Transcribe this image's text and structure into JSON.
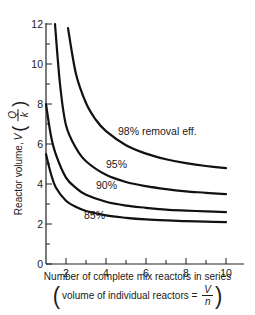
{
  "chart_data": {
    "type": "line",
    "title": "",
    "xlabel": "Number of complete mix reactors in series",
    "xlabel_sub": {
      "prefix": "volume of individual reactors =",
      "fraction_numerator": "V",
      "fraction_denominator": "n"
    },
    "ylabel": {
      "prefix": "Reactor volume,",
      "symbol": "V",
      "fraction_numerator": "Q",
      "fraction_denominator": "k"
    },
    "xlim": [
      1,
      11
    ],
    "ylim": [
      0,
      12
    ],
    "x_ticks": [
      2,
      4,
      6,
      8,
      10
    ],
    "x_minor_ticks": [
      3,
      5,
      7,
      9
    ],
    "y_ticks": [
      0,
      2,
      4,
      6,
      8,
      10,
      12
    ],
    "y_minor_ticks": [
      1,
      3,
      5,
      7,
      9,
      11
    ],
    "grid": false,
    "legend": "inline labels on curves",
    "series": [
      {
        "name": "98% removal eff.",
        "label": "98% removal eff.",
        "x": [
          2.1,
          2.5,
          3,
          3.5,
          4,
          5,
          6,
          7,
          8,
          9,
          10
        ],
        "values": [
          11.8,
          9.5,
          8.05,
          7.2,
          6.64,
          5.94,
          5.52,
          5.24,
          5.04,
          4.9,
          4.79
        ]
      },
      {
        "name": "95%",
        "label": "95%",
        "x": [
          1.45,
          1.7,
          2,
          2.5,
          3,
          4,
          5,
          6,
          7,
          8,
          9,
          10
        ],
        "values": [
          12.0,
          9.0,
          6.94,
          5.8,
          5.14,
          4.46,
          4.1,
          3.89,
          3.74,
          3.63,
          3.56,
          3.49
        ]
      },
      {
        "name": "90%",
        "label": "90%",
        "x": [
          1.0,
          1.25,
          1.5,
          2,
          2.5,
          3,
          4,
          5,
          6,
          7,
          8,
          9,
          10
        ],
        "values": [
          8.0,
          6.4,
          5.46,
          4.32,
          3.8,
          3.46,
          3.11,
          2.92,
          2.81,
          2.72,
          2.67,
          2.63,
          2.59
        ]
      },
      {
        "name": "85%",
        "label": "85%",
        "x": [
          1.0,
          1.25,
          1.5,
          2,
          2.5,
          3,
          4,
          5,
          6,
          7,
          8,
          9,
          10
        ],
        "values": [
          5.5,
          4.5,
          3.81,
          3.16,
          2.85,
          2.65,
          2.43,
          2.31,
          2.23,
          2.18,
          2.14,
          2.12,
          2.09
        ]
      }
    ]
  },
  "labels": {
    "xlabel": "Number of complete mix reactors in series",
    "xlabel_sub_prefix": "volume of individual reactors =",
    "xlabel_sub_num": "V",
    "xlabel_sub_den": "n",
    "open_paren": "(",
    "close_paren": ")",
    "ylabel_prefix": "Reactor volume,",
    "ylabel_symbol": "V",
    "ylabel_num": "Q",
    "ylabel_den": "k"
  },
  "colors": {
    "line": "#111111",
    "axis": "#222222",
    "background": "#ffffff"
  }
}
